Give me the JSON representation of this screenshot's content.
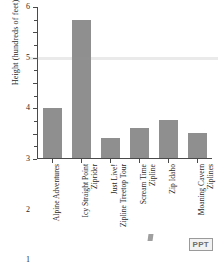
{
  "chart_data": {
    "type": "bar",
    "title": "",
    "xlabel": "",
    "ylabel": "Height (hundreds of feet)",
    "ylim": [
      0,
      6
    ],
    "yticks": [
      0,
      1,
      2,
      3,
      4,
      5,
      6
    ],
    "ytick_labels": [
      "",
      "1",
      "2",
      "3",
      "4",
      "5",
      "6"
    ],
    "minor_tick_step": 0.5,
    "grid": false,
    "legend": null,
    "bar_color": "#8f8f8f",
    "categories": [
      "Alpine Adventures",
      "Icy Straight Point Ziprider",
      "Just Live! Zipline Treetop Tour",
      "Scream Time Zipline",
      "Zip Idaho",
      "Moaning Cavern Ziplines"
    ],
    "category_lines": [
      [
        "Alpine Adventures",
        ""
      ],
      [
        "Icy Straight Point",
        "Ziprider"
      ],
      [
        "Just Live!",
        "Zipline Treetop Tour"
      ],
      [
        "Scream Time",
        "Zipline"
      ],
      [
        "Zip Idaho",
        ""
      ],
      [
        "Moaning Cavern",
        "Ziplines"
      ]
    ],
    "values": [
      2.0,
      5.5,
      0.8,
      1.2,
      1.5,
      1.0
    ]
  },
  "watermark": {
    "label": "PPT"
  },
  "caption": {
    "text": ""
  }
}
